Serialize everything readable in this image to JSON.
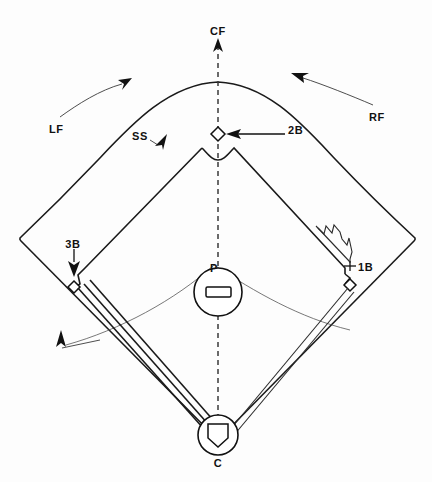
{
  "diagram": {
    "background_color": "#fdfdfd",
    "line_color": "#111111",
    "width": 432,
    "height": 482,
    "labels": {
      "center_field": "CF",
      "left_field": "LF",
      "right_field": "RF",
      "shortstop": "SS",
      "second_base": "2B",
      "third_base": "3B",
      "first_base": "1B",
      "pitcher": "P",
      "catcher": "C"
    },
    "markers": [
      {
        "key": "center_field",
        "label": "CF",
        "x": 218,
        "y": 31,
        "type": "position-label"
      },
      {
        "key": "left_field",
        "label": "LF",
        "x": 58,
        "y": 129,
        "type": "position-label"
      },
      {
        "key": "right_field",
        "label": "RF",
        "x": 377,
        "y": 117,
        "type": "position-label"
      },
      {
        "key": "shortstop",
        "label": "SS",
        "x": 140,
        "y": 136,
        "type": "position-label"
      },
      {
        "key": "second_base",
        "label": "2B",
        "x": 296,
        "y": 130,
        "type": "base-label"
      },
      {
        "key": "third_base",
        "label": "3B",
        "x": 72,
        "y": 244,
        "type": "base-label"
      },
      {
        "key": "first_base",
        "label": "1B",
        "x": 364,
        "y": 271,
        "type": "base-label"
      },
      {
        "key": "pitcher",
        "label": "P",
        "x": 214,
        "y": 270,
        "type": "position-label"
      },
      {
        "key": "catcher",
        "label": "C",
        "x": 218,
        "y": 461,
        "type": "position-label"
      }
    ],
    "arrows": [
      {
        "key": "cf-arrow",
        "from": "CF label",
        "direction": "up",
        "style": "straight"
      },
      {
        "key": "lf-arrow",
        "from": "LF label",
        "direction": "up-right",
        "style": "curved"
      },
      {
        "key": "rf-arrow",
        "from": "RF label",
        "direction": "up-left",
        "style": "curved"
      },
      {
        "key": "ss-arrow",
        "from": "SS label",
        "direction": "up-right",
        "style": "short"
      },
      {
        "key": "2b-arrow",
        "from": "2B label",
        "direction": "left",
        "style": "straight"
      },
      {
        "key": "3b-arrow",
        "from": "3B label",
        "direction": "down",
        "style": "straight"
      },
      {
        "key": "1b-arrow",
        "from": "1B label",
        "direction": "left",
        "style": "tick"
      },
      {
        "key": "grass-arc-arrow",
        "from": "infield grass arc",
        "direction": "up-left",
        "style": "leader"
      }
    ]
  }
}
